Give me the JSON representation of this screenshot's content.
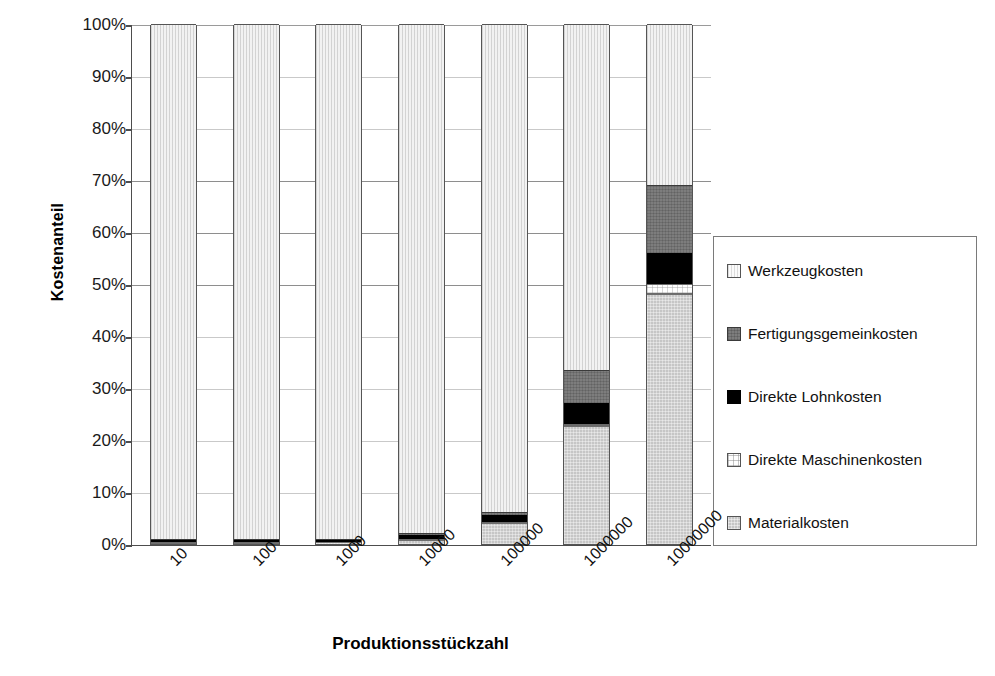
{
  "chart_data": {
    "type": "bar",
    "stacked": true,
    "stack_mode": "percent",
    "title": "",
    "xlabel": "Produktionsstückzahl",
    "ylabel": "Kostenanteil",
    "categories": [
      "10",
      "100",
      "1000",
      "10000",
      "100000",
      "1000000",
      "10000000"
    ],
    "ylim": [
      0,
      100
    ],
    "ytick_labels": [
      "0%",
      "10%",
      "20%",
      "30%",
      "40%",
      "50%",
      "60%",
      "70%",
      "80%",
      "90%",
      "100%"
    ],
    "ytick_values": [
      0,
      10,
      20,
      30,
      40,
      50,
      60,
      70,
      80,
      90,
      100
    ],
    "grid": true,
    "legend_position": "right",
    "series": [
      {
        "name": "Materialkosten",
        "swatch": "sw-material",
        "seg_class": "seg-material",
        "values": [
          0.2,
          0.25,
          0.3,
          0.8,
          4.0,
          22.6,
          48.0
        ]
      },
      {
        "name": "Direkte Maschinenkosten",
        "swatch": "sw-maschine",
        "seg_class": "seg-maschine",
        "values": [
          0.1,
          0.1,
          0.1,
          0.2,
          0.3,
          0.5,
          2.0
        ]
      },
      {
        "name": "Direkte Lohnkosten",
        "swatch": "sw-lohn",
        "seg_class": "seg-lohn",
        "values": [
          0.4,
          0.4,
          0.4,
          0.8,
          1.2,
          4.0,
          6.0
        ]
      },
      {
        "name": "Fertigungsgemeinkosten",
        "swatch": "sw-gemein",
        "seg_class": "seg-gemein",
        "values": [
          0.2,
          0.2,
          0.2,
          0.4,
          0.6,
          6.4,
          13.0
        ]
      },
      {
        "name": "Werkzeugkosten",
        "swatch": "sw-werkzeug",
        "seg_class": "seg-werkzeug",
        "values": [
          99.1,
          99.05,
          99.0,
          97.8,
          93.9,
          66.5,
          31.0
        ]
      }
    ]
  },
  "axes": {
    "y_title": "Kostenanteil",
    "x_title": "Produktionsstückzahl"
  }
}
